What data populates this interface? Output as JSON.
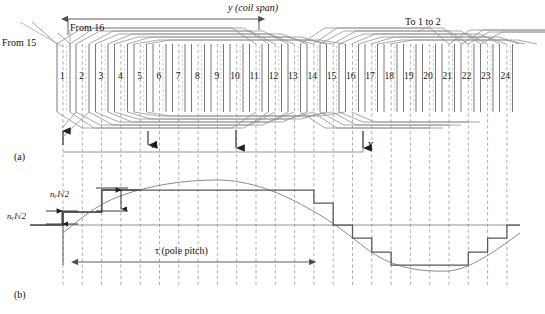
{
  "figure": {
    "panel_a_label": "(a)",
    "panel_b_label": "(b)"
  },
  "panel_a": {
    "coil_span_label": "y (coil span)",
    "from_15_label": "From 15",
    "from_16_label": "From 16",
    "to_1_to_2_label": "To 1 to 2",
    "terminal_a_label": "A",
    "terminal_x_label": "X",
    "slot_numbers": [
      "1",
      "2",
      "3",
      "4",
      "5",
      "6",
      "7",
      "8",
      "9",
      "10",
      "11",
      "12",
      "13",
      "14",
      "15",
      "16",
      "17",
      "18",
      "19",
      "20",
      "21",
      "22",
      "23",
      "24"
    ],
    "slot_count": 24,
    "coil_span_slots": 10
  },
  "panel_b": {
    "pole_pitch_label": "τ (pole pitch)",
    "amplitude_label_upper": "nₑI√2",
    "amplitude_label_lower": "nₑI√2",
    "amp_n": "n",
    "amp_c": "c",
    "amp_rest": "I√2"
  },
  "colors": {
    "ink": "#1a1a1a",
    "solid_line": "#4d4d4d",
    "dashed_grid": "#9a9a9a",
    "coil_line": "#8c8c8c",
    "sine_curve": "#8c8c8c",
    "stair": "#585858",
    "axis": "#7a7a7a"
  },
  "chart_data": {
    "type": "line",
    "xlabel": "Slot number",
    "ylabel": "MMF",
    "categories": [
      "1",
      "2",
      "3",
      "4",
      "5",
      "6",
      "7",
      "8",
      "9",
      "10",
      "11",
      "12",
      "13",
      "14",
      "15",
      "16",
      "17",
      "18",
      "19",
      "20",
      "21",
      "22",
      "23",
      "24"
    ],
    "series": [
      {
        "name": "Stepped MMF (staircase)",
        "values": [
          -3,
          -1,
          1,
          3,
          3,
          3,
          3,
          3,
          3,
          3,
          1,
          -1,
          -3,
          -3,
          -3,
          -3,
          -3,
          -3,
          -3,
          -3,
          -3,
          -1,
          1,
          3
        ]
      },
      {
        "name": "Fundamental sine wave",
        "values": [
          -2.0,
          -0.6,
          0.9,
          2.1,
          2.9,
          3.2,
          3.1,
          2.5,
          1.5,
          0.3,
          -1.0,
          -2.1,
          -2.9,
          -3.2,
          -3.1,
          -2.8,
          -2.4,
          -2.2,
          -2.3,
          -2.6,
          -2.9,
          -2.6,
          -1.6,
          -0.1
        ]
      }
    ],
    "ylim": [
      -4,
      4
    ],
    "grid": true,
    "legend": "none",
    "annotations": [
      "τ (pole pitch)",
      "nₑI√2"
    ]
  }
}
